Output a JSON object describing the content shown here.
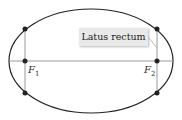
{
  "diagram": {
    "callout_label": "Latus rectum",
    "focus_labels": [
      {
        "name": "F",
        "sub": "1"
      },
      {
        "name": "F",
        "sub": "2"
      }
    ],
    "colors": {
      "curve": "#222222",
      "axis": "#999999",
      "dot": "#222222",
      "callout_bg": "#e9e9e9"
    }
  }
}
